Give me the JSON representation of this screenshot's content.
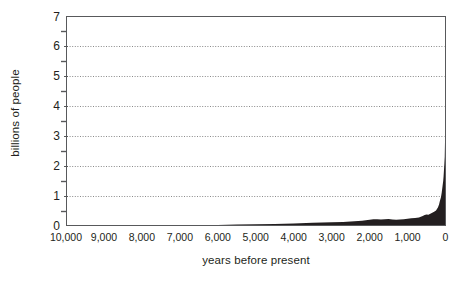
{
  "chart_data": {
    "type": "area",
    "title": "",
    "subtitle": "",
    "xlabel": "years before present",
    "ylabel": "billions of people",
    "x_tick_labels": [
      "10,000",
      "9,000",
      "8,000",
      "7,000",
      "6,000",
      "5,000",
      "4,000",
      "3,000",
      "2,000",
      "1,000",
      "0"
    ],
    "x_tick_values": [
      10000,
      9000,
      8000,
      7000,
      6000,
      5000,
      4000,
      3000,
      2000,
      1000,
      0
    ],
    "y_tick_labels": [
      "0",
      "1",
      "2",
      "3",
      "4",
      "5",
      "6",
      "7"
    ],
    "y_tick_values": [
      0,
      1,
      2,
      3,
      4,
      5,
      6,
      7
    ],
    "y_minor_tick_values": [
      0.5,
      1.5,
      2.5,
      3.5,
      4.5,
      5.5,
      6.5
    ],
    "xlim": [
      10000,
      0
    ],
    "ylim": [
      0,
      7
    ],
    "x_axis_direction": "reversed",
    "grid": "horizontal-dotted-major",
    "legend": "none",
    "fill_color": "#231f20",
    "grid_color": "#8a8a8a",
    "axis_color": "#58595b",
    "text_color": "#231f20",
    "background_color": "#ffffff",
    "series": [
      {
        "name": "world population",
        "units": "billions of people",
        "x": [
          10000,
          9500,
          9000,
          8500,
          8000,
          7500,
          7000,
          6500,
          6000,
          5500,
          5000,
          4500,
          4000,
          3500,
          3000,
          2700,
          2400,
          2200,
          2000,
          1900,
          1800,
          1700,
          1600,
          1500,
          1400,
          1300,
          1200,
          1100,
          1000,
          900,
          800,
          700,
          650,
          600,
          550,
          500,
          450,
          400,
          350,
          300,
          250,
          200,
          170,
          150,
          120,
          100,
          80,
          60,
          50,
          40,
          30,
          20,
          10,
          0
        ],
        "values": [
          0.004,
          0.004,
          0.005,
          0.005,
          0.005,
          0.006,
          0.007,
          0.01,
          0.02,
          0.03,
          0.04,
          0.05,
          0.07,
          0.09,
          0.11,
          0.12,
          0.14,
          0.16,
          0.19,
          0.21,
          0.21,
          0.2,
          0.21,
          0.22,
          0.2,
          0.19,
          0.2,
          0.21,
          0.23,
          0.24,
          0.25,
          0.27,
          0.29,
          0.32,
          0.35,
          0.37,
          0.36,
          0.39,
          0.43,
          0.46,
          0.5,
          0.6,
          0.7,
          0.81,
          0.95,
          1.1,
          1.3,
          1.5,
          1.65,
          1.86,
          2.07,
          2.3,
          3.0,
          5.0
        ]
      }
    ]
  },
  "axis": {
    "ylabel_text": "billions of people",
    "xlabel_text": "years before present"
  }
}
